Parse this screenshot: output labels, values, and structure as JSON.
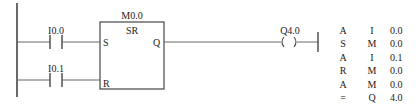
{
  "ladder": {
    "contacts": [
      {
        "label": "I0.0",
        "type": "normally-open"
      },
      {
        "label": "I0.1",
        "type": "normally-open"
      }
    ],
    "sr_block": {
      "address": "M0.0",
      "type": "SR",
      "pin_set": "S",
      "pin_reset": "R",
      "pin_out": "Q"
    },
    "coil": {
      "label": "Q4.0",
      "symbol": "( )"
    }
  },
  "stl": {
    "rows": [
      {
        "op": "A",
        "area": "I",
        "addr": "0.0"
      },
      {
        "op": "S",
        "area": "M",
        "addr": "0.0"
      },
      {
        "op": "A",
        "area": "I",
        "addr": "0.1"
      },
      {
        "op": "R",
        "area": "M",
        "addr": "0.0"
      },
      {
        "op": "A",
        "area": "M",
        "addr": "0.0"
      },
      {
        "op": "=",
        "area": "Q",
        "addr": "4.0"
      }
    ]
  },
  "colors": {
    "line": "#555555",
    "text": "#222222",
    "background": "#ffffff"
  }
}
